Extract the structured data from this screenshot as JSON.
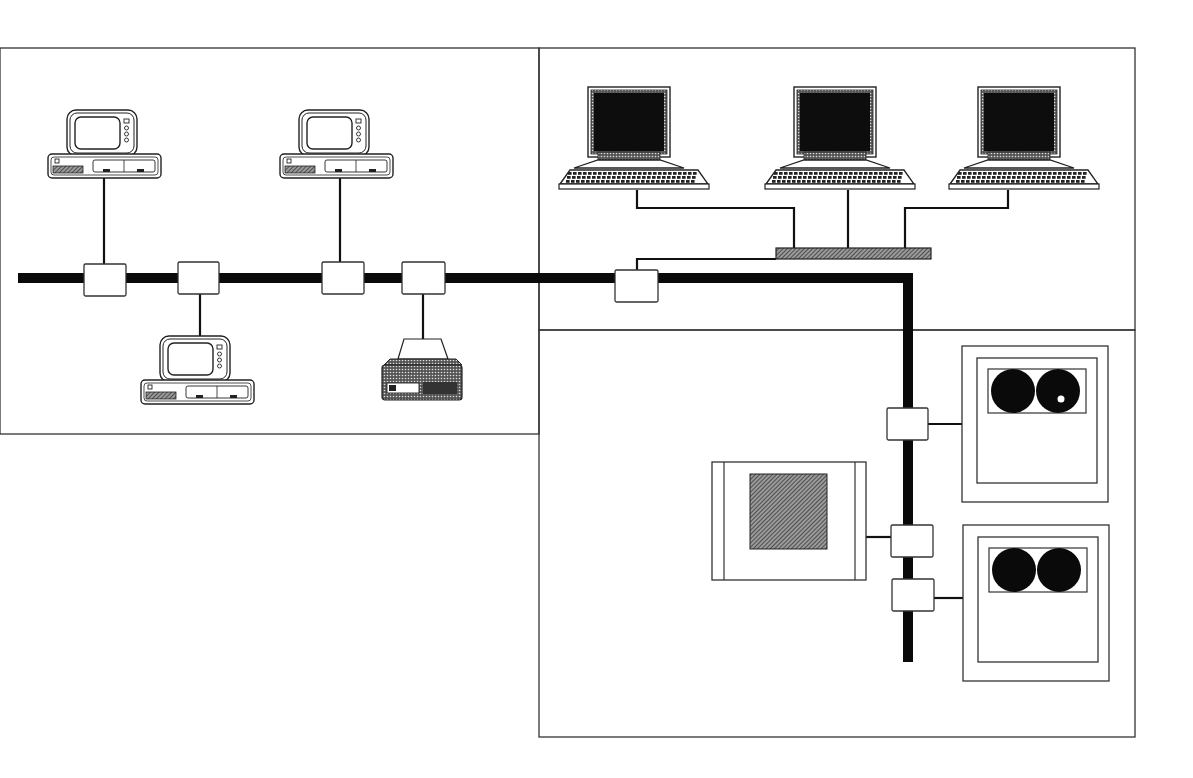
{
  "diagram": {
    "type": "network-topology",
    "colors": {
      "line": "#333333",
      "bus": "#0a0a0a",
      "hatch": "#6a6a6a",
      "screen": "#111111",
      "background": "#ffffff"
    },
    "panels": [
      {
        "id": "left-workstation-segment",
        "x": 0,
        "y": 48,
        "w": 539,
        "h": 386
      },
      {
        "id": "upper-right-terminal-cluster",
        "x": 539,
        "y": 48,
        "w": 596,
        "h": 282
      },
      {
        "id": "lower-right-storage-segment",
        "x": 539,
        "y": 330,
        "w": 596,
        "h": 407
      }
    ],
    "bus": {
      "points": [
        [
          18,
          278
        ],
        [
          908,
          278
        ],
        [
          908,
          662
        ]
      ]
    },
    "taps": [
      {
        "id": "tap-pc-1",
        "x": 84,
        "y": 264,
        "w": 42,
        "h": 32
      },
      {
        "id": "tap-pc-3",
        "x": 178,
        "y": 262,
        "w": 41,
        "h": 32
      },
      {
        "id": "tap-pc-2",
        "x": 322,
        "y": 262,
        "w": 42,
        "h": 32
      },
      {
        "id": "tap-printer",
        "x": 402,
        "y": 262,
        "w": 43,
        "h": 32
      },
      {
        "id": "tap-hub",
        "x": 615,
        "y": 270,
        "w": 43,
        "h": 32
      },
      {
        "id": "tap-disk-1",
        "x": 887,
        "y": 408,
        "w": 41,
        "h": 32
      },
      {
        "id": "tap-tape",
        "x": 891,
        "y": 525,
        "w": 42,
        "h": 32
      },
      {
        "id": "tap-disk-2",
        "x": 892,
        "y": 579,
        "w": 42,
        "h": 32
      }
    ],
    "desktop_pcs": [
      {
        "id": "pc-1",
        "x": 47,
        "y": 108,
        "drop": [
          [
            104,
            178
          ],
          [
            104,
            264
          ]
        ]
      },
      {
        "id": "pc-2",
        "x": 279,
        "y": 108,
        "drop": [
          [
            340,
            178
          ],
          [
            340,
            262
          ]
        ]
      },
      {
        "id": "pc-3",
        "x": 140,
        "y": 334,
        "drop": [
          [
            200,
            294
          ],
          [
            200,
            336
          ]
        ]
      }
    ],
    "printer": {
      "id": "printer",
      "x": 380,
      "y": 335,
      "drop": [
        [
          423,
          294
        ],
        [
          423,
          340
        ]
      ]
    },
    "terminals": [
      {
        "id": "terminal-1",
        "x": 558,
        "y": 86
      },
      {
        "id": "terminal-2",
        "x": 764,
        "y": 86
      },
      {
        "id": "terminal-3",
        "x": 948,
        "y": 86
      }
    ],
    "hub": {
      "id": "hub-concentrator",
      "x": 776,
      "y": 248,
      "w": 155,
      "h": 11
    },
    "hub_wires": [
      [
        [
          637,
          190
        ],
        [
          637,
          208
        ],
        [
          794,
          208
        ],
        [
          794,
          248
        ]
      ],
      [
        [
          848,
          190
        ],
        [
          848,
          248
        ]
      ],
      [
        [
          1008,
          190
        ],
        [
          1008,
          208
        ],
        [
          905,
          208
        ],
        [
          905,
          248
        ]
      ],
      [
        [
          637,
          270
        ],
        [
          637,
          259
        ],
        [
          776,
          259
        ]
      ]
    ],
    "disk_units": [
      {
        "id": "disk-unit-1",
        "x": 962,
        "y": 346,
        "w": 146,
        "h": 156,
        "wire": [
          [
            928,
            424
          ],
          [
            962,
            424
          ]
        ]
      },
      {
        "id": "disk-unit-2",
        "x": 963,
        "y": 525,
        "w": 146,
        "h": 156,
        "wire": [
          [
            934,
            598
          ],
          [
            963,
            598
          ]
        ]
      }
    ],
    "tape_unit": {
      "id": "tape-unit",
      "x": 712,
      "y": 462,
      "w": 154,
      "h": 118,
      "wire": [
        [
          866,
          537
        ],
        [
          891,
          537
        ]
      ]
    }
  }
}
